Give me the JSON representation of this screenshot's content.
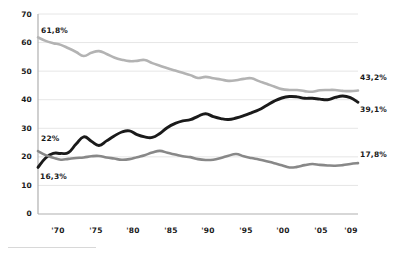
{
  "chart_data": {
    "type": "line",
    "title": "",
    "subtitle": "",
    "xlabel": "",
    "ylabel": "",
    "xlim": [
      1967,
      2009
    ],
    "ylim": [
      0,
      70
    ],
    "grid": true,
    "legend": "none",
    "x_tick_labels": [
      "'70",
      "'75",
      "'80",
      "'85",
      "'90",
      "'95",
      "'00",
      "'05",
      "'09"
    ],
    "x_ticks": [
      1970,
      1975,
      1980,
      1985,
      1990,
      1995,
      2000,
      2005,
      2009
    ],
    "y_tick_labels": [
      "0",
      "10",
      "20",
      "30",
      "40",
      "50",
      "60",
      "70"
    ],
    "y_ticks": [
      0,
      10,
      20,
      30,
      40,
      50,
      60,
      70
    ],
    "x": [
      1967,
      1968,
      1969,
      1970,
      1971,
      1972,
      1973,
      1974,
      1975,
      1976,
      1977,
      1978,
      1979,
      1980,
      1981,
      1982,
      1983,
      1984,
      1985,
      1986,
      1987,
      1988,
      1989,
      1990,
      1991,
      1992,
      1993,
      1994,
      1995,
      1996,
      1997,
      1998,
      1999,
      2000,
      2001,
      2002,
      2003,
      2004,
      2005,
      2006,
      2007,
      2008,
      2009
    ],
    "series": [
      {
        "name": "upper",
        "color": "#b3b3b3",
        "width": 2.6,
        "start_label": "61,8%",
        "end_label": "43,2%",
        "values": [
          61.8,
          60.6,
          59.8,
          59.2,
          58.0,
          56.7,
          55.3,
          56.4,
          57.0,
          56.0,
          54.8,
          54.0,
          53.5,
          53.6,
          53.9,
          52.8,
          51.9,
          51.0,
          50.2,
          49.4,
          48.6,
          47.6,
          48.0,
          47.5,
          47.1,
          46.6,
          46.8,
          47.3,
          47.5,
          46.5,
          45.6,
          44.6,
          43.7,
          43.4,
          43.4,
          43.0,
          42.8,
          43.3,
          43.4,
          43.4,
          43.1,
          43.0,
          43.2
        ]
      },
      {
        "name": "middle",
        "color": "#1a1a1a",
        "width": 2.9,
        "start_label": "16,3%",
        "end_label": "39,1%",
        "values": [
          16.3,
          19.6,
          21.2,
          21.2,
          21.5,
          24.5,
          27.0,
          25.5,
          24.0,
          25.6,
          27.3,
          28.7,
          29.1,
          27.8,
          27.0,
          26.8,
          28.2,
          30.3,
          31.7,
          32.6,
          33.0,
          34.2,
          35.1,
          34.1,
          33.4,
          33.1,
          33.6,
          34.4,
          35.4,
          36.5,
          38.0,
          39.5,
          40.6,
          41.1,
          41.0,
          40.5,
          40.5,
          40.2,
          40.0,
          40.8,
          41.3,
          40.7,
          39.1
        ]
      },
      {
        "name": "lower",
        "color": "#888888",
        "width": 2.6,
        "start_label": "22%",
        "end_label": "17,8%",
        "values": [
          22.0,
          20.6,
          19.7,
          19.0,
          19.3,
          19.6,
          19.8,
          20.2,
          20.3,
          19.8,
          19.4,
          19.0,
          19.2,
          19.9,
          20.6,
          21.5,
          22.1,
          21.4,
          20.8,
          20.2,
          19.9,
          19.2,
          18.9,
          19.0,
          19.6,
          20.4,
          21.0,
          20.2,
          19.6,
          19.1,
          18.5,
          17.8,
          17.1,
          16.3,
          16.5,
          17.1,
          17.5,
          17.2,
          17.0,
          16.9,
          17.1,
          17.5,
          17.8
        ]
      }
    ],
    "annotations": [
      {
        "text": "61,8%",
        "series": "upper",
        "position": "start-above"
      },
      {
        "text": "43,2%",
        "series": "upper",
        "position": "end-above"
      },
      {
        "text": "22%",
        "series": "lower",
        "position": "start-above"
      },
      {
        "text": "17,8%",
        "series": "lower",
        "position": "end-above"
      },
      {
        "text": "16,3%",
        "series": "middle",
        "position": "start-below"
      },
      {
        "text": "39,1%",
        "series": "middle",
        "position": "end-below"
      }
    ]
  },
  "axis": {
    "y_labels": [
      "70",
      "60",
      "50",
      "40",
      "30",
      "20",
      "10",
      "0"
    ],
    "x_labels": [
      "'70",
      "'75",
      "'80",
      "'85",
      "'90",
      "'95",
      "'00",
      "'05",
      "'09"
    ]
  },
  "colors": {
    "upper_line": "#b3b3b3",
    "middle_line": "#1a1a1a",
    "lower_line": "#888888",
    "grid": "#e6e6e6",
    "axis": "#b0b0b0",
    "text": "#1a1a1a",
    "background": "#ffffff"
  }
}
